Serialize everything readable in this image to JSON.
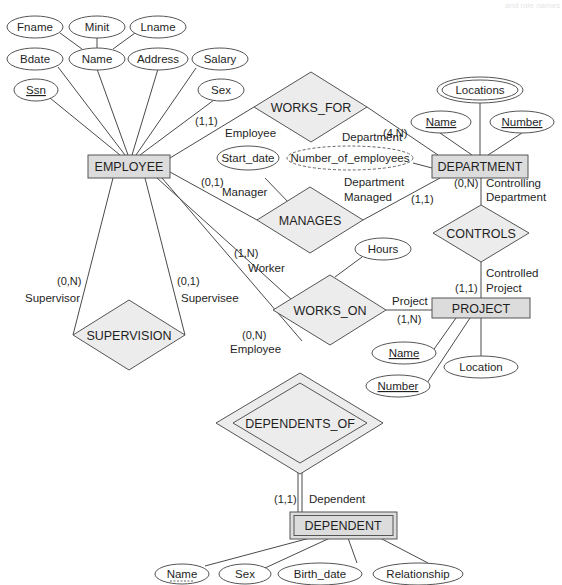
{
  "diagram": {
    "type": "ER diagram",
    "corner_text": "and role names",
    "colors": {
      "entity_fill": "#dcdcdc",
      "relationship_fill": "#ececec",
      "stroke": "#555555",
      "background": "#ffffff"
    },
    "entities": [
      {
        "id": "employee",
        "name": "EMPLOYEE",
        "weak": false
      },
      {
        "id": "department",
        "name": "DEPARTMENT",
        "weak": false
      },
      {
        "id": "project",
        "name": "PROJECT",
        "weak": false
      },
      {
        "id": "dependent",
        "name": "DEPENDENT",
        "weak": true
      }
    ],
    "relationships": [
      {
        "id": "works_for",
        "name": "WORKS_FOR",
        "identifying": false
      },
      {
        "id": "manages",
        "name": "MANAGES",
        "identifying": false
      },
      {
        "id": "controls",
        "name": "CONTROLS",
        "identifying": false
      },
      {
        "id": "works_on",
        "name": "WORKS_ON",
        "identifying": false
      },
      {
        "id": "supervision",
        "name": "SUPERVISION",
        "identifying": false
      },
      {
        "id": "dependents_of",
        "name": "DEPENDENTS_OF",
        "identifying": true
      }
    ],
    "attributes": {
      "employee": {
        "fname": "Fname",
        "minit": "Minit",
        "lname": "Lname",
        "bdate": "Bdate",
        "name": "Name",
        "address": "Address",
        "salary": "Salary",
        "ssn": "Ssn",
        "sex": "Sex"
      },
      "department": {
        "locations": "Locations",
        "name": "Name",
        "number": "Number",
        "number_of_employees": "Number_of_employees"
      },
      "manages": {
        "start_date": "Start_date"
      },
      "works_on": {
        "hours": "Hours"
      },
      "project": {
        "name": "Name",
        "number": "Number",
        "location": "Location"
      },
      "dependent": {
        "name": "Name",
        "sex": "Sex",
        "birth_date": "Birth_date",
        "relationship": "Relationship"
      }
    },
    "constraints": {
      "works_for_employee": {
        "card": "(1,1)",
        "role": "Employee"
      },
      "works_for_department": {
        "card": "(4,N)",
        "role": "Department"
      },
      "manages_employee": {
        "card": "(0,1)",
        "role": "Manager"
      },
      "manages_department": {
        "card": "(1,1)",
        "role_line1": "Department",
        "role_line2": "Managed"
      },
      "controls_department": {
        "card": "(0,N)",
        "role_line1": "Controlling",
        "role_line2": "Department"
      },
      "controls_project": {
        "card": "(1,1)",
        "role_line1": "Controlled",
        "role_line2": "Project"
      },
      "works_on_employee": {
        "card": "(1,N)",
        "role": "Worker"
      },
      "works_on_project": {
        "card": "(1,N)",
        "role": "Project"
      },
      "supervision_supervisor": {
        "card": "(0,N)",
        "role": "Supervisor"
      },
      "supervision_supervisee": {
        "card": "(0,1)",
        "role": "Supervisee"
      },
      "dependents_of_employee": {
        "card": "(0,N)",
        "role": "Employee"
      },
      "dependents_of_dependent": {
        "card": "(1,1)",
        "role": "Dependent"
      }
    }
  }
}
